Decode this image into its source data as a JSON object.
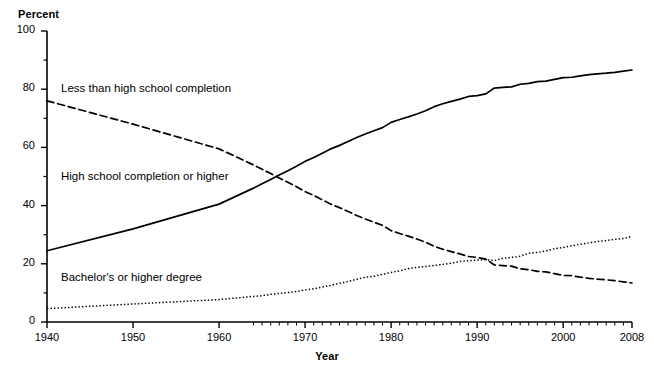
{
  "chart_data": {
    "type": "line",
    "title": "",
    "xlabel": "Year",
    "ylabel": "Percent",
    "xlim": [
      1940,
      2008
    ],
    "ylim": [
      0,
      100
    ],
    "grid": false,
    "legend_position": "inline-annotations",
    "x_tick_labels": [
      "1940",
      "1950",
      "1960",
      "1970",
      "1980",
      "1990",
      "2000",
      "2008"
    ],
    "x_ticks": [
      1940,
      1950,
      1960,
      1970,
      1980,
      1990,
      2000,
      2008
    ],
    "x_minor_tick_start": 1964,
    "x_minor_tick_step": 1,
    "y_tick_labels": [
      "0",
      "20",
      "40",
      "60",
      "80",
      "100"
    ],
    "y_ticks": [
      0,
      20,
      40,
      60,
      80,
      100
    ],
    "y_minor_ticks": [
      10,
      30,
      50,
      70,
      90
    ],
    "series": [
      {
        "name": "Less than high school completion",
        "style": "dashed",
        "color": "#000000",
        "x": [
          1940,
          1950,
          1960,
          1964,
          1965,
          1966,
          1967,
          1968,
          1969,
          1970,
          1971,
          1972,
          1973,
          1974,
          1975,
          1976,
          1977,
          1978,
          1979,
          1980,
          1981,
          1982,
          1983,
          1984,
          1985,
          1986,
          1987,
          1988,
          1989,
          1990,
          1991,
          1992,
          1993,
          1994,
          1995,
          1996,
          1997,
          1998,
          1999,
          2000,
          2001,
          2002,
          2003,
          2004,
          2005,
          2006,
          2007,
          2008
        ],
        "values": [
          76.0,
          68.0,
          59.5,
          54.0,
          52.5,
          51.0,
          49.5,
          48.0,
          46.5,
          44.8,
          43.5,
          42.0,
          40.5,
          39.3,
          38.0,
          36.6,
          35.4,
          34.3,
          33.2,
          31.4,
          30.4,
          29.5,
          28.5,
          27.4,
          26.0,
          25.0,
          24.2,
          23.4,
          22.5,
          22.2,
          21.6,
          19.6,
          19.4,
          19.2,
          18.3,
          18.0,
          17.4,
          17.2,
          16.6,
          16.0,
          15.9,
          15.4,
          15.0,
          14.7,
          14.5,
          14.2,
          13.8,
          13.4
        ]
      },
      {
        "name": "High school completion or higher",
        "style": "solid",
        "color": "#000000",
        "x": [
          1940,
          1950,
          1960,
          1964,
          1965,
          1966,
          1967,
          1968,
          1969,
          1970,
          1971,
          1972,
          1973,
          1974,
          1975,
          1976,
          1977,
          1978,
          1979,
          1980,
          1981,
          1982,
          1983,
          1984,
          1985,
          1986,
          1987,
          1988,
          1989,
          1990,
          1991,
          1992,
          1993,
          1994,
          1995,
          1996,
          1997,
          1998,
          1999,
          2000,
          2001,
          2002,
          2003,
          2004,
          2005,
          2006,
          2007,
          2008
        ],
        "values": [
          24.5,
          32.0,
          40.5,
          46.0,
          47.5,
          49.0,
          50.5,
          52.0,
          53.5,
          55.2,
          56.5,
          58.0,
          59.5,
          60.7,
          62.0,
          63.4,
          64.6,
          65.7,
          66.8,
          68.6,
          69.6,
          70.5,
          71.5,
          72.6,
          74.0,
          75.0,
          75.8,
          76.6,
          77.5,
          77.8,
          78.4,
          80.4,
          80.6,
          80.8,
          81.7,
          82.0,
          82.6,
          82.8,
          83.4,
          84.0,
          84.1,
          84.6,
          85.0,
          85.3,
          85.5,
          85.8,
          86.2,
          86.6
        ]
      },
      {
        "name": "Bachelor's or higher degree",
        "style": "dotted",
        "color": "#000000",
        "x": [
          1940,
          1950,
          1960,
          1964,
          1965,
          1966,
          1967,
          1968,
          1969,
          1970,
          1971,
          1972,
          1973,
          1974,
          1975,
          1976,
          1977,
          1978,
          1979,
          1980,
          1981,
          1982,
          1983,
          1984,
          1985,
          1986,
          1987,
          1988,
          1989,
          1990,
          1991,
          1992,
          1993,
          1994,
          1995,
          1996,
          1997,
          1998,
          1999,
          2000,
          2001,
          2002,
          2003,
          2004,
          2005,
          2006,
          2007,
          2008
        ],
        "values": [
          4.6,
          6.2,
          7.7,
          8.8,
          9.0,
          9.5,
          9.8,
          10.1,
          10.5,
          11.0,
          11.4,
          12.0,
          12.6,
          13.3,
          13.9,
          14.7,
          15.4,
          15.7,
          16.4,
          17.0,
          17.6,
          18.3,
          18.8,
          19.1,
          19.4,
          19.8,
          20.2,
          20.8,
          21.1,
          21.3,
          21.4,
          21.1,
          21.9,
          22.2,
          22.6,
          23.6,
          23.9,
          24.4,
          25.2,
          25.6,
          26.2,
          26.7,
          27.2,
          27.7,
          28.0,
          28.4,
          28.7,
          29.4
        ]
      }
    ]
  },
  "labels": {
    "y_axis_title": "Percent",
    "x_axis_title": "Year"
  }
}
